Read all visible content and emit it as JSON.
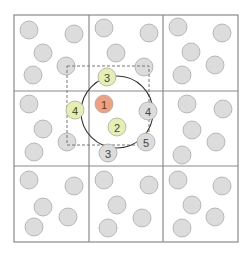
{
  "diagram": {
    "type": "spatial-grid-neighbor-search",
    "grid": {
      "left": 14,
      "top": 15,
      "right": 238,
      "bottom": 242,
      "col_lines": [
        89,
        163
      ],
      "row_lines": [
        91,
        166
      ],
      "line_color": "#8a8a8a"
    },
    "colors": {
      "background_particle": "#dcdcdc",
      "particle_stroke": "#aaaaaa",
      "query_particle": "#f0a080",
      "neighbor_particle": "#e6efb0",
      "candidate_particle": "#dcdcdc",
      "search_circle": "#333333",
      "search_box": "#777777"
    },
    "search_circle": {
      "cx": 117,
      "cy": 112,
      "r": 36
    },
    "search_box": {
      "x": 67,
      "y": 66,
      "width": 82,
      "height": 79
    },
    "labeled_particles": [
      {
        "label": "1",
        "role": "query",
        "cx": 104,
        "cy": 104
      },
      {
        "label": "3",
        "role": "neighbor",
        "cx": 107,
        "cy": 77
      },
      {
        "label": "4",
        "role": "neighbor",
        "cx": 75,
        "cy": 110
      },
      {
        "label": "2",
        "role": "neighbor",
        "cx": 117,
        "cy": 127
      },
      {
        "label": "4",
        "role": "candidate",
        "cx": 148,
        "cy": 111
      },
      {
        "label": "5",
        "role": "candidate",
        "cx": 146,
        "cy": 142
      },
      {
        "label": "3",
        "role": "candidate",
        "cx": 108,
        "cy": 153
      }
    ],
    "background_particles": [
      {
        "cx": 29,
        "cy": 30
      },
      {
        "cx": 74,
        "cy": 34
      },
      {
        "cx": 43,
        "cy": 53
      },
      {
        "cx": 33,
        "cy": 75
      },
      {
        "cx": 66,
        "cy": 66
      },
      {
        "cx": 104,
        "cy": 28
      },
      {
        "cx": 149,
        "cy": 33
      },
      {
        "cx": 116,
        "cy": 53
      },
      {
        "cx": 144,
        "cy": 67
      },
      {
        "cx": 178,
        "cy": 27
      },
      {
        "cx": 222,
        "cy": 33
      },
      {
        "cx": 191,
        "cy": 52
      },
      {
        "cx": 215,
        "cy": 65
      },
      {
        "cx": 182,
        "cy": 75
      },
      {
        "cx": 29,
        "cy": 104
      },
      {
        "cx": 43,
        "cy": 129
      },
      {
        "cx": 34,
        "cy": 152
      },
      {
        "cx": 67,
        "cy": 142
      },
      {
        "cx": 187,
        "cy": 104
      },
      {
        "cx": 223,
        "cy": 109
      },
      {
        "cx": 192,
        "cy": 130
      },
      {
        "cx": 216,
        "cy": 142
      },
      {
        "cx": 182,
        "cy": 155
      },
      {
        "cx": 29,
        "cy": 180
      },
      {
        "cx": 74,
        "cy": 186
      },
      {
        "cx": 43,
        "cy": 207
      },
      {
        "cx": 34,
        "cy": 227
      },
      {
        "cx": 68,
        "cy": 217
      },
      {
        "cx": 104,
        "cy": 180
      },
      {
        "cx": 149,
        "cy": 185
      },
      {
        "cx": 117,
        "cy": 205
      },
      {
        "cx": 142,
        "cy": 218
      },
      {
        "cx": 108,
        "cy": 228
      },
      {
        "cx": 178,
        "cy": 180
      },
      {
        "cx": 222,
        "cy": 186
      },
      {
        "cx": 192,
        "cy": 205
      },
      {
        "cx": 215,
        "cy": 217
      },
      {
        "cx": 182,
        "cy": 228
      }
    ],
    "particle_radius": 9
  }
}
